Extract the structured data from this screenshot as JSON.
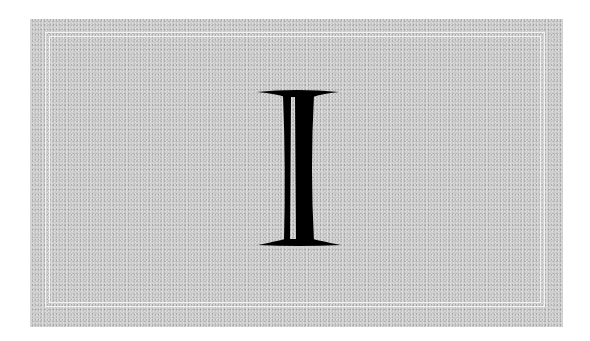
{
  "card": {
    "glyph": "I",
    "glyph_description": "Decorative serif capital letter I with inline (hollow stripe) stem",
    "colors": {
      "background": "#ffffff",
      "card": "#c9c9c9",
      "frame_lines": "#f2f2f2",
      "glyph": "#000000"
    }
  }
}
